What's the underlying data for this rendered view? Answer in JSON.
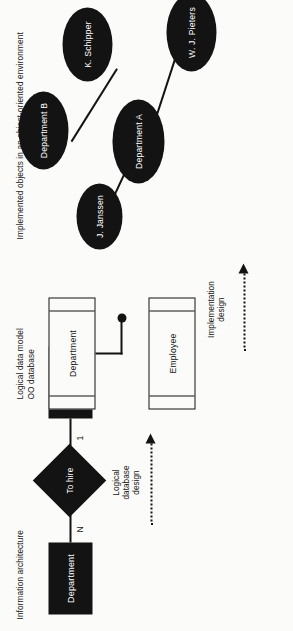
{
  "figure": {
    "orientation": "rotated-90"
  },
  "stages": [
    {
      "id": "information-architecture",
      "heading": "Information architecture",
      "type": "entity-relationship",
      "entities": [
        {
          "name": "Department",
          "shape": "rectangle"
        },
        {
          "name": "Employee",
          "shape": "rectangle"
        }
      ],
      "relationship": {
        "name": "To hire",
        "shape": "diamond"
      },
      "cardinalities": [
        {
          "near": "Department",
          "value": "N"
        },
        {
          "near": "Employee",
          "value": "1"
        }
      ]
    },
    {
      "id": "logical-data-model",
      "heading": "Logical data model\nOO database",
      "type": "class-diagram",
      "classes": [
        {
          "name": "Department",
          "compartments": 3
        },
        {
          "name": "Employee",
          "compartments": 3
        }
      ],
      "association": {
        "marker": "filled-circle"
      }
    },
    {
      "id": "implemented-objects",
      "heading": "Implemented objects in an object-oriented environment",
      "type": "object-diagram",
      "objects": [
        {
          "name": "Department A",
          "kind": "department"
        },
        {
          "name": "Department B",
          "kind": "department"
        },
        {
          "name": "J. Janssen",
          "kind": "person"
        },
        {
          "name": "K. Schipper",
          "kind": "person"
        },
        {
          "name": "W. J. Pieters",
          "kind": "person"
        }
      ],
      "links": [
        {
          "from": "J. Janssen",
          "to": "Department A"
        },
        {
          "from": "Department A",
          "to": "W. J. Pieters"
        },
        {
          "from": "Department B",
          "to": "K. Schipper"
        }
      ]
    }
  ],
  "transitions": [
    {
      "id": "logical-database-design",
      "label": "Logical\ndatabase\ndesign",
      "style": "dotted-arrow"
    },
    {
      "id": "implementation-design",
      "label": "Implementation\ndesign",
      "style": "dotted-arrow"
    }
  ],
  "colors": {
    "ink": "#131313",
    "paper": "#fbfbf9",
    "fill_text": "#ffffff"
  }
}
